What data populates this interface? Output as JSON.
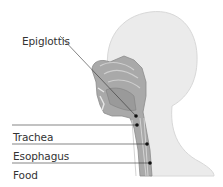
{
  "diagram": {
    "title": "",
    "labels": [
      {
        "id": "epiglottis",
        "text": "Epiglottis",
        "x": 22,
        "y": 33
      },
      {
        "id": "trachea",
        "text": "Trachea",
        "x": 13,
        "y": 129
      },
      {
        "id": "esophagus",
        "text": "Esophagus",
        "x": 13,
        "y": 148
      },
      {
        "id": "food",
        "text": "Food",
        "x": 13,
        "y": 167
      }
    ],
    "colors": {
      "background": "#ffffff",
      "head": "#ebebeb",
      "head_outline": "#d8d8d8",
      "section": "#a9a9a9",
      "section_dark": "#8c8c8c",
      "leader": "#333333",
      "dot": "#111111",
      "text": "#333333"
    }
  }
}
